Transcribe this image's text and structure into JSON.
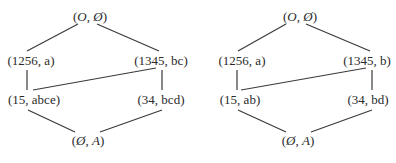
{
  "diagrams": [
    {
      "name": "lattice-left",
      "nodes": {
        "top": {
          "open": "(",
          "a": "O",
          "sep": ", ",
          "b": "Ø",
          "close": ")"
        },
        "n1256": "(1256, a)",
        "n1345": "(1345, bc)",
        "n15": "(15, abce)",
        "n34": "(34, bcd)",
        "bottom": {
          "open": "(",
          "a": "Ø",
          "sep": ", ",
          "b": "A",
          "close": ")"
        }
      },
      "edges": [
        [
          "top",
          "n1256"
        ],
        [
          "top",
          "n1345"
        ],
        [
          "n1256",
          "n15"
        ],
        [
          "n1345",
          "n34"
        ],
        [
          "n1345",
          "n15"
        ],
        [
          "n15",
          "bottom"
        ],
        [
          "n34",
          "bottom"
        ]
      ]
    },
    {
      "name": "lattice-right",
      "nodes": {
        "top": {
          "open": "(",
          "a": "O",
          "sep": ", ",
          "b": "Ø",
          "close": ")"
        },
        "n1256": "(1256, a)",
        "n1345": "(1345, b)",
        "n15": "(15, ab)",
        "n34": "(34, bd)",
        "bottom": {
          "open": "(",
          "a": "Ø",
          "sep": ", ",
          "b": "A",
          "close": ")"
        }
      },
      "edges": [
        [
          "top",
          "n1256"
        ],
        [
          "top",
          "n1345"
        ],
        [
          "n1256",
          "n15"
        ],
        [
          "n1345",
          "n34"
        ],
        [
          "n1345",
          "n15"
        ],
        [
          "n15",
          "bottom"
        ],
        [
          "n34",
          "bottom"
        ]
      ]
    }
  ]
}
